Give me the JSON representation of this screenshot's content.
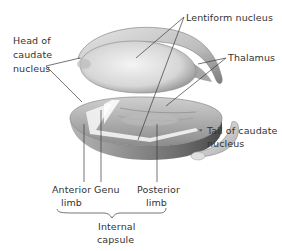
{
  "diagram": {
    "labels": {
      "head_caudate_1": "Head of",
      "head_caudate_2": "caudate",
      "head_caudate_3": "nucleus",
      "lentiform": "Lentiform nucleus",
      "thalamus": "Thalamus",
      "tail_caudate_1": "Tail of caudate",
      "tail_caudate_2": "nucleus",
      "anterior_1": "Anterior",
      "anterior_2": "limb",
      "genu": "Genu",
      "posterior_1": "Posterior",
      "posterior_2": "limb",
      "internal_capsule_1": "Internal",
      "internal_capsule_2": "capsule"
    },
    "structures": [
      "head-of-caudate-nucleus",
      "lentiform-nucleus",
      "thalamus",
      "tail-of-caudate-nucleus",
      "internal-capsule-anterior-limb",
      "internal-capsule-genu",
      "internal-capsule-posterior-limb"
    ],
    "colors": {
      "ink": "#333333",
      "shade_dark": "#6a6a6a",
      "shade_mid": "#a8a8a8",
      "shade_light": "#dcdcdc",
      "background": "#ffffff"
    }
  }
}
